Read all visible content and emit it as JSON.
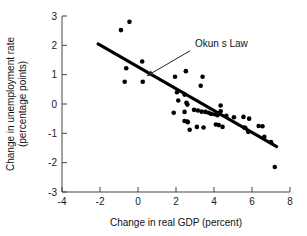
{
  "chart_data": {
    "type": "scatter",
    "title": "",
    "xlabel": "Change in real GDP (percent)",
    "ylabel": "Change in unemployment rate (percentage points)",
    "ylabel_line1": "Change in unemployment rate",
    "ylabel_line2": "(percentage points)",
    "xlim": [
      -4,
      8
    ],
    "ylim": [
      -3,
      3
    ],
    "xticks": [
      -4,
      -2,
      0,
      2,
      4,
      6,
      8
    ],
    "yticks": [
      3,
      2,
      1,
      0,
      -1,
      -2,
      -3
    ],
    "xtick_labels": [
      "-4",
      "-2",
      "0",
      "2",
      "4",
      "6",
      "8"
    ],
    "ytick_labels": [
      "3",
      "2",
      "1",
      "0",
      "-1",
      "-2",
      "-3"
    ],
    "grid": false,
    "legend": "none",
    "marker": "filled-circle",
    "marker_color": "#000000",
    "annotations": [
      {
        "text": "Okun s Law",
        "x": 3.0,
        "y": 1.95,
        "pointer_to_x": 0.45,
        "pointer_to_y": 0.95
      }
    ],
    "trend_line": {
      "name": "Okun's Law",
      "x_start": -2.1,
      "y_start": 2.05,
      "x_end": 7.3,
      "y_end": -1.45,
      "color": "#000000",
      "width": 3.1
    },
    "points": [
      {
        "x": -0.9,
        "y": 2.52
      },
      {
        "x": -0.45,
        "y": 2.8
      },
      {
        "x": -0.62,
        "y": 1.22
      },
      {
        "x": 0.22,
        "y": 1.45
      },
      {
        "x": -0.7,
        "y": 0.76
      },
      {
        "x": 0.25,
        "y": 0.76
      },
      {
        "x": 1.95,
        "y": 0.93
      },
      {
        "x": 2.52,
        "y": 1.12
      },
      {
        "x": 3.4,
        "y": 0.93
      },
      {
        "x": 3.3,
        "y": 0.62
      },
      {
        "x": 2.05,
        "y": 0.4
      },
      {
        "x": 2.45,
        "y": 0.32
      },
      {
        "x": 2.12,
        "y": 0.12
      },
      {
        "x": 2.55,
        "y": 0.04
      },
      {
        "x": 2.6,
        "y": -0.02
      },
      {
        "x": 1.88,
        "y": -0.3
      },
      {
        "x": 2.45,
        "y": -0.27
      },
      {
        "x": 2.95,
        "y": -0.2
      },
      {
        "x": 3.15,
        "y": -0.22
      },
      {
        "x": 3.35,
        "y": -0.26
      },
      {
        "x": 3.55,
        "y": -0.27
      },
      {
        "x": 3.72,
        "y": -0.3
      },
      {
        "x": 3.85,
        "y": -0.34
      },
      {
        "x": 4.05,
        "y": -0.35
      },
      {
        "x": 4.18,
        "y": -0.38
      },
      {
        "x": 4.35,
        "y": -0.05
      },
      {
        "x": 4.35,
        "y": -0.25
      },
      {
        "x": 4.65,
        "y": -0.4
      },
      {
        "x": 5.05,
        "y": -0.45
      },
      {
        "x": 5.55,
        "y": -0.44
      },
      {
        "x": 5.85,
        "y": -0.5
      },
      {
        "x": 2.45,
        "y": -0.58
      },
      {
        "x": 2.62,
        "y": -0.62
      },
      {
        "x": 2.6,
        "y": -0.6
      },
      {
        "x": 3.1,
        "y": -0.78
      },
      {
        "x": 3.45,
        "y": -0.8
      },
      {
        "x": 2.72,
        "y": -0.88
      },
      {
        "x": 4.1,
        "y": -0.7
      },
      {
        "x": 4.25,
        "y": -0.72
      },
      {
        "x": 4.45,
        "y": -0.78
      },
      {
        "x": 5.6,
        "y": -0.8
      },
      {
        "x": 5.65,
        "y": -0.82
      },
      {
        "x": 6.35,
        "y": -0.75
      },
      {
        "x": 6.55,
        "y": -0.76
      },
      {
        "x": 5.8,
        "y": -0.95
      },
      {
        "x": 6.65,
        "y": -1.12
      },
      {
        "x": 7.0,
        "y": -1.3
      },
      {
        "x": 7.2,
        "y": -2.15
      }
    ]
  }
}
